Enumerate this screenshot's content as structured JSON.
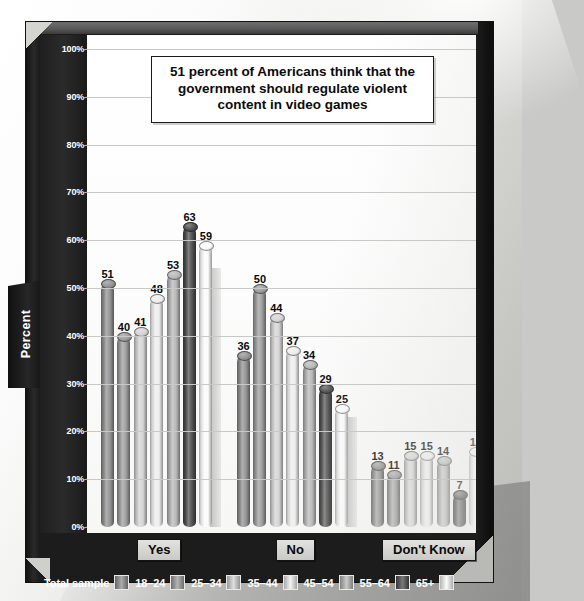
{
  "chart_data": {
    "type": "bar",
    "title": "51 percent of Americans think that the government should regulate violent content in video games",
    "xlabel": "",
    "ylabel": "Percent",
    "ylim": [
      0,
      100
    ],
    "ytick_labels": [
      "100%",
      "90%",
      "80%",
      "70%",
      "60%",
      "50%",
      "40%",
      "30%",
      "20%",
      "10%",
      "0%"
    ],
    "ytick_values": [
      100,
      90,
      80,
      70,
      60,
      50,
      40,
      30,
      20,
      10,
      0
    ],
    "grid": true,
    "legend_position": "bottom",
    "categories": [
      "Yes",
      "No",
      "Don't Know"
    ],
    "series": [
      {
        "name": "Total sample",
        "values": [
          51,
          36,
          13
        ],
        "color": "#8e8e8e"
      },
      {
        "name": "18–24",
        "values": [
          40,
          50,
          11
        ],
        "color": "#9a9a9a"
      },
      {
        "name": "25–34",
        "values": [
          41,
          44,
          15
        ],
        "color": "#d2d2d2"
      },
      {
        "name": "35–44",
        "values": [
          48,
          37,
          15
        ],
        "color": "#ededed"
      },
      {
        "name": "45–54",
        "values": [
          53,
          34,
          14
        ],
        "color": "#b5b5b5"
      },
      {
        "name": "55–64",
        "values": [
          63,
          29,
          7
        ],
        "color": "#4a4a4a"
      },
      {
        "name": "65+",
        "values": [
          59,
          25,
          16
        ],
        "color": "#fafafa"
      }
    ]
  },
  "legend": {
    "entries": [
      {
        "label": "Total sample"
      },
      {
        "label": "18–24"
      },
      {
        "label": "25–34"
      },
      {
        "label": "35–44"
      },
      {
        "label": "45–54"
      },
      {
        "label": "55–64"
      },
      {
        "label": "65+"
      }
    ]
  },
  "axis": {
    "y_title": "Percent"
  },
  "colors": {
    "frame": "#1c1c1c",
    "plot_background": "#ffffff",
    "gridline": "#c8c8c6",
    "label_text": "#0a0a0a"
  }
}
